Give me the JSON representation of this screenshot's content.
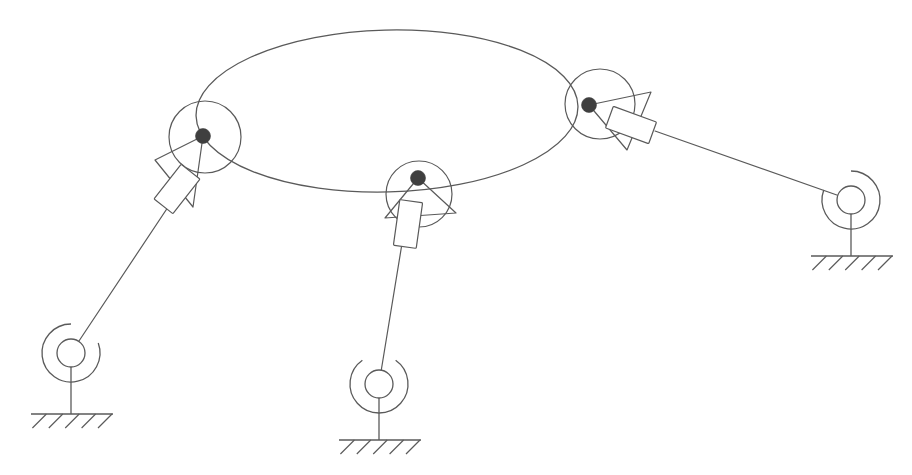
{
  "diagram": {
    "background_color": "#ffffff",
    "line_color": "#5a5a5a",
    "pivot_color": "#3f3f3f",
    "canvas": {
      "width": 912,
      "height": 475
    }
  },
  "platform": {
    "name": "moving-platform",
    "shape": "ellipse",
    "center_x": 387,
    "center_y": 111,
    "radius_x": 191,
    "radius_y": 81,
    "rotation_deg": -1.5
  },
  "legs": [
    {
      "id": "leg-left",
      "label": "Left leg",
      "joint": {
        "circle_cx": 205,
        "circle_cy": 137,
        "circle_r": 36,
        "pivot_cx": 203,
        "pivot_cy": 136,
        "pivot_r": 7.5,
        "triangle_points": "203,136 155,160 193,207",
        "slider_cx": 177,
        "slider_cy": 189,
        "slider_w": 24,
        "slider_h": 44,
        "slider_rotation_deg": 38
      },
      "rod": {
        "x1": 190,
        "y1": 174,
        "x2": 71,
        "y2": 353
      },
      "ground": {
        "hub_cx": 71,
        "hub_cy": 353,
        "hub_r": 14,
        "arc_r": 29,
        "arc_gap_deg": 70,
        "arc_mid_deg": -55,
        "stem_x": 71,
        "stem_top": 382,
        "base_y": 414,
        "base_x1": 31,
        "base_x2": 113,
        "hatch_count": 5
      }
    },
    {
      "id": "leg-middle",
      "label": "Middle leg",
      "joint": {
        "circle_cx": 419,
        "circle_cy": 194,
        "circle_r": 33,
        "pivot_cx": 418,
        "pivot_cy": 178,
        "pivot_r": 7.5,
        "triangle_points": "418,178 385,218 456,213",
        "slider_cx": 408,
        "slider_cy": 224,
        "slider_w": 23,
        "slider_h": 46,
        "slider_rotation_deg": 8
      },
      "rod": {
        "x1": 407,
        "y1": 213,
        "x2": 379,
        "y2": 384
      },
      "ground": {
        "hub_cx": 379,
        "hub_cy": 384,
        "hub_r": 14,
        "arc_r": 29,
        "arc_gap_deg": 70,
        "arc_mid_deg": -90,
        "stem_x": 379,
        "stem_top": 413,
        "base_y": 440,
        "base_x1": 339,
        "base_x2": 421,
        "hatch_count": 5
      }
    },
    {
      "id": "leg-right",
      "label": "Right leg",
      "joint": {
        "circle_cx": 600,
        "circle_cy": 104,
        "circle_r": 35,
        "pivot_cx": 589,
        "pivot_cy": 105,
        "pivot_r": 7.5,
        "triangle_points": "589,105 651,92 627,150"
      },
      "slider": {
        "slider_cx": 631,
        "slider_cy": 125,
        "slider_w": 23,
        "slider_h": 46,
        "slider_rotation_deg": 110
      },
      "rod": {
        "x1": 655,
        "y1": 131,
        "x2": 851,
        "y2": 200
      },
      "ground": {
        "hub_cx": 851,
        "hub_cy": 200,
        "hub_r": 14,
        "arc_r": 29,
        "arc_gap_deg": 70,
        "arc_mid_deg": -125,
        "stem_x": 851,
        "stem_top": 229,
        "base_y": 256,
        "base_x1": 811,
        "base_x2": 893,
        "hatch_count": 5
      }
    }
  ]
}
